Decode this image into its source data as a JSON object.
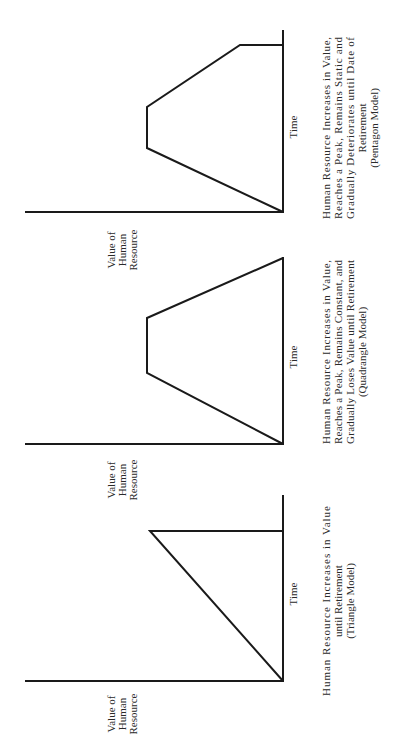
{
  "diagrams": [
    {
      "name": "pentagon",
      "axis_label_value": [
        "Value of",
        "Human",
        "Resource"
      ],
      "axis_label_time": "Time",
      "caption": [
        "Human Resource Increases in Value,",
        "Reaches a Peak, Remains Static and",
        "Gradually Deteriorates until Date of",
        "Retirement",
        "(Pentagon Model)"
      ]
    },
    {
      "name": "quadrangle",
      "axis_label_value": [
        "Value of",
        "Human",
        "Resource"
      ],
      "axis_label_time": "Time",
      "caption": [
        "Human Resource Increases in Value,",
        "Reaches a Peak, Remains Constant, and",
        "Gradually Loses Value until Retirement",
        "(Quadrangle Model)"
      ]
    },
    {
      "name": "triangle",
      "axis_label_value": [
        "Value of",
        "Human",
        "Resource"
      ],
      "axis_label_time": "Time",
      "caption": [
        "Human Resource Increases in Value",
        "until Retirement",
        "(Triangle Model)"
      ]
    }
  ],
  "colors": {
    "line": "#1a1a1a",
    "text": "#2a2a2a",
    "background": "#ffffff"
  }
}
